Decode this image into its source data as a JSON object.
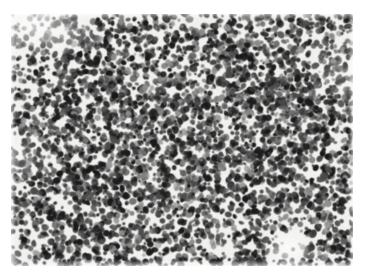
{
  "page": {
    "width": 366,
    "height": 279,
    "background_color": "#ffffff",
    "caption": ""
  },
  "micrograph": {
    "label": "histopathology micrograph",
    "description": "densely packed dark stained nuclei on a pale background, monochrome scanned tissue field",
    "stain": "monochrome",
    "frame": {
      "x": 11,
      "y": 14,
      "width": 342,
      "height": 252
    },
    "background_color": "#f1f1ef",
    "nucleus_color_dark": "#1a1a1a",
    "nucleus_color_mid": "#4a4a4a",
    "nucleus_color_light": "#8c8c8c",
    "field": {
      "seed": 20240517,
      "nucleus_count": 5200,
      "nucleus_radius_min": 1.3,
      "nucleus_radius_max": 3.3,
      "blur_px": 0.45,
      "grain_strength": 13,
      "base_gray": 241
    },
    "density_zones": [
      {
        "name": "top-left-pale",
        "cx": 0.07,
        "cy": 0.05,
        "rx": 0.2,
        "ry": 0.17,
        "density": 0.3
      },
      {
        "name": "left-upper-pale",
        "cx": 0.02,
        "cy": 0.2,
        "rx": 0.09,
        "ry": 0.14,
        "density": 0.45
      },
      {
        "name": "bottom-right-pale-patch",
        "cx": 0.81,
        "cy": 0.93,
        "rx": 0.09,
        "ry": 0.09,
        "density": 0.26
      },
      {
        "name": "left-mid-light",
        "cx": 0.03,
        "cy": 0.56,
        "rx": 0.07,
        "ry": 0.12,
        "density": 0.62
      },
      {
        "name": "right-upper-light",
        "cx": 0.985,
        "cy": 0.2,
        "rx": 0.06,
        "ry": 0.12,
        "density": 0.66
      },
      {
        "name": "center-dense",
        "cx": 0.5,
        "cy": 0.48,
        "rx": 0.46,
        "ry": 0.44,
        "density": 1.08
      },
      {
        "name": "lower-left-dense",
        "cx": 0.26,
        "cy": 0.8,
        "rx": 0.24,
        "ry": 0.2,
        "density": 1.1
      },
      {
        "name": "upper-right-dense",
        "cx": 0.72,
        "cy": 0.22,
        "rx": 0.26,
        "ry": 0.2,
        "density": 1.06
      }
    ]
  }
}
